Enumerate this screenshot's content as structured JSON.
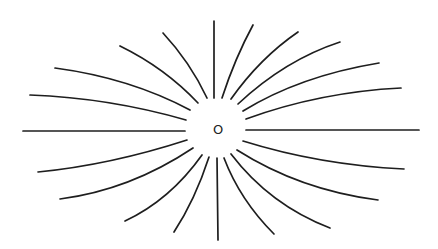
{
  "diagram": {
    "title": "",
    "center_label": "O",
    "center": [
      218,
      130
    ],
    "stroke_color": "#1e1e1e",
    "background": "#ffffff",
    "lines": [
      {
        "id": "top-vertical",
        "d": "M214,21 L214,98"
      },
      {
        "id": "upper-left-1",
        "d": "M207,98 Q190,62 163,33"
      },
      {
        "id": "upper-left-2",
        "d": "M198,103 Q165,68 120,46"
      },
      {
        "id": "upper-left-3",
        "d": "M190,110 Q130,78 55,68"
      },
      {
        "id": "upper-left-4",
        "d": "M186,120 Q110,98 30,95"
      },
      {
        "id": "left-horizontal",
        "d": "M185,131 L23,131"
      },
      {
        "id": "lower-left-1",
        "d": "M187,140 Q110,165 38,172"
      },
      {
        "id": "lower-left-2",
        "d": "M193,148 Q130,190 60,199"
      },
      {
        "id": "lower-left-3",
        "d": "M202,155 Q170,200 125,221"
      },
      {
        "id": "lower-left-4",
        "d": "M209,157 Q195,200 174,232"
      },
      {
        "id": "bottom-vertical",
        "d": "M217,158 L218,240"
      },
      {
        "id": "lower-right-1",
        "d": "M224,158 Q240,200 274,234"
      },
      {
        "id": "lower-right-2",
        "d": "M231,154 Q270,205 330,228"
      },
      {
        "id": "lower-right-3",
        "d": "M237,150 Q300,190 378,200"
      },
      {
        "id": "lower-right-4",
        "d": "M243,141 Q320,165 404,169"
      },
      {
        "id": "right-horizontal",
        "d": "M246,130 L419,130"
      },
      {
        "id": "upper-right-1",
        "d": "M246,119 Q320,92 401,88"
      },
      {
        "id": "upper-right-2",
        "d": "M243,111 Q300,76 379,63"
      },
      {
        "id": "upper-right-3",
        "d": "M238,104 Q285,60 340,42"
      },
      {
        "id": "upper-right-4",
        "d": "M231,99 Q260,58 298,32"
      },
      {
        "id": "upper-right-5",
        "d": "M222,98 Q235,58 253,25"
      }
    ]
  }
}
